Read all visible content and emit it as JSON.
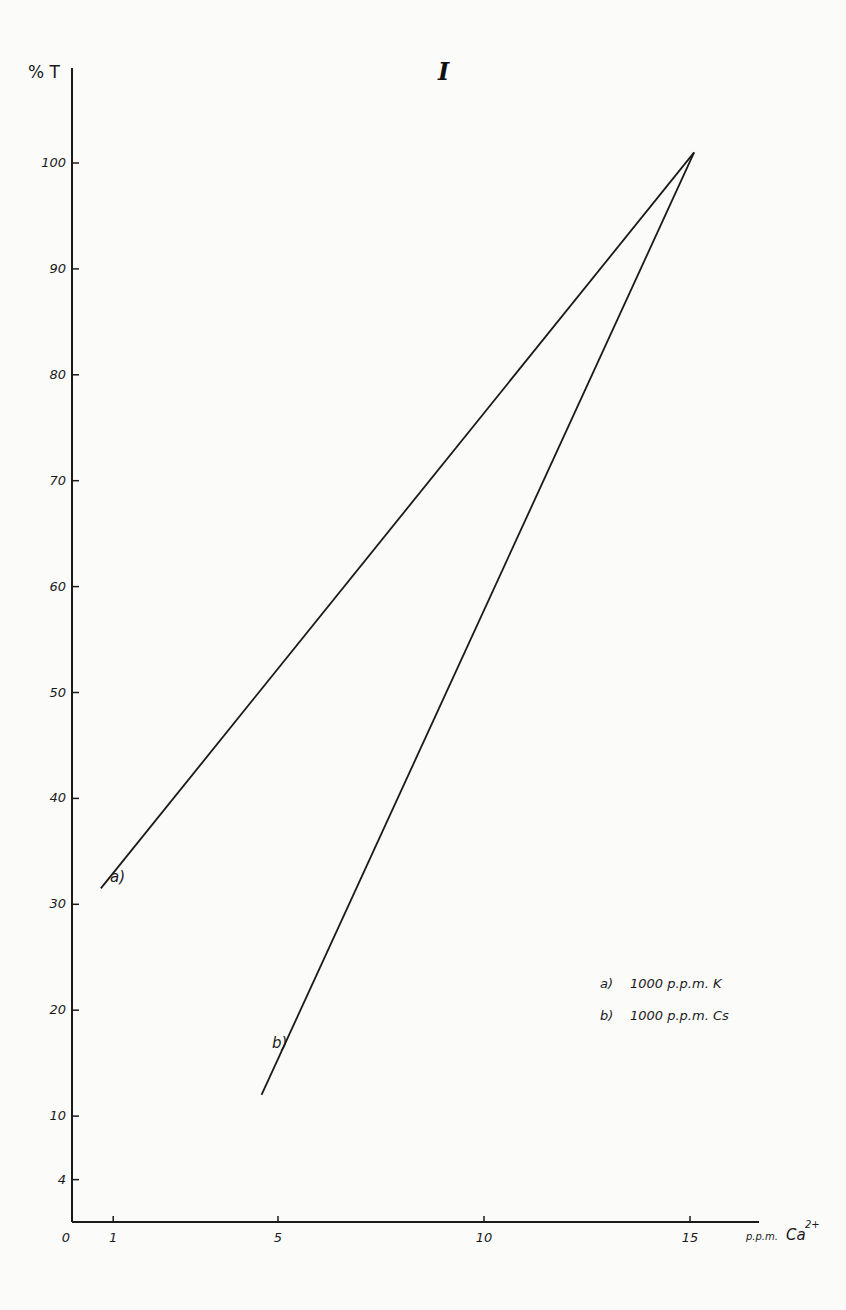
{
  "chart_data": {
    "type": "line",
    "title": "I",
    "xlabel": "p.p.m. Ca²⁺",
    "xlabel_main": "p.p.m. Ca",
    "xlabel_sup": "2+",
    "ylabel": "% T",
    "xlim": [
      0,
      16.7
    ],
    "ylim": [
      0,
      105
    ],
    "grid": false,
    "legend_position": "lower-right",
    "x_ticks": [
      0,
      1,
      5,
      10,
      15
    ],
    "x_tick_labels": [
      "0",
      "1",
      "5",
      "10",
      "15"
    ],
    "y_ticks": [
      4,
      10,
      20,
      30,
      40,
      50,
      60,
      70,
      80,
      90,
      100
    ],
    "y_tick_labels": [
      "4",
      "10",
      "20",
      "30",
      "40",
      "50",
      "60",
      "70",
      "80",
      "90",
      "100"
    ],
    "series": [
      {
        "name": "a) 1000 p.p.m. K",
        "label": "a)",
        "x": [
          0.7,
          15.1
        ],
        "y": [
          31.5,
          101
        ]
      },
      {
        "name": "b) 1000 p.p.m. Cs",
        "label": "b)",
        "x": [
          4.6,
          15.1
        ],
        "y": [
          12,
          101
        ]
      }
    ],
    "legend": [
      {
        "key": "a)",
        "text": "1000 p.p.m. K"
      },
      {
        "key": "b)",
        "text": "1000 p.p.m. Cs"
      }
    ]
  },
  "colors": {
    "background": "#fbfbfa",
    "ink": "#1a1a1a"
  }
}
